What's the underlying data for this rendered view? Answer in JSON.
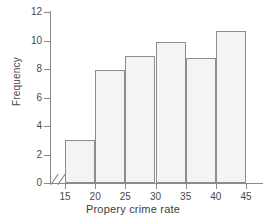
{
  "chart_data": {
    "type": "bar",
    "title": "",
    "subtitle": "",
    "xlabel": "Propery crime rate",
    "ylabel": "Frequency",
    "grid": false,
    "legend": null,
    "bin_edges": [
      15,
      20,
      25,
      30,
      35,
      40,
      45
    ],
    "categories": [
      "15-20",
      "20-25",
      "25-30",
      "30-35",
      "35-40",
      "40-45"
    ],
    "values": [
      3.0,
      7.9,
      8.9,
      9.9,
      8.8,
      10.7
    ],
    "xlim": [
      15,
      45
    ],
    "ylim": [
      0,
      12
    ],
    "x_ticks": [
      15,
      20,
      25,
      30,
      35,
      40,
      45
    ],
    "y_ticks": [
      0,
      2,
      4,
      6,
      8,
      10,
      12
    ],
    "x_tick_labels": [
      "15",
      "20",
      "25",
      "30",
      "35",
      "40",
      "45"
    ],
    "y_tick_labels": [
      "0",
      "2",
      "4",
      "6",
      "8",
      "10",
      "12"
    ],
    "axis_break": "x",
    "bar_fill_color": "#f4f4f2",
    "bar_border_color": "#8d8d8d",
    "axis_color": "#8a8a8a",
    "text_color": "#4a4a4a"
  }
}
